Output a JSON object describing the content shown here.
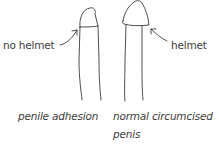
{
  "diagram": {
    "left_figure": {
      "label": "no helmet",
      "caption": "penile adhesion"
    },
    "right_figure": {
      "label": "helmet",
      "caption_line1": "normal circumcised",
      "caption_line2": "penis"
    },
    "colors": {
      "stroke": "#3a3a3a",
      "background": "#ffffff"
    }
  }
}
